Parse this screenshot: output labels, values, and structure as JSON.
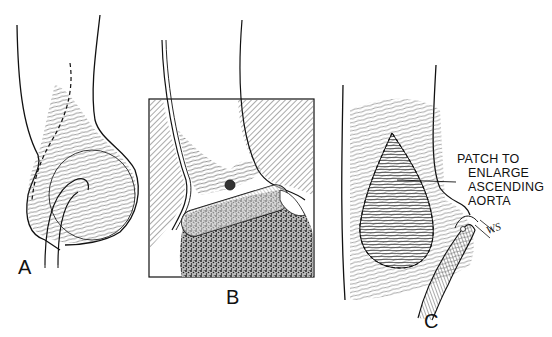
{
  "figure": {
    "panels": [
      {
        "id": "A",
        "label": "A"
      },
      {
        "id": "B",
        "label": "B"
      },
      {
        "id": "C",
        "label": "C"
      }
    ],
    "callout": {
      "lines": [
        "PATCH TO",
        "ENLARGE",
        "ASCENDING",
        "AORTA"
      ]
    },
    "signature": "WS",
    "colors": {
      "ink": "#111111",
      "background": "#ffffff",
      "hatch": "#555555"
    }
  }
}
